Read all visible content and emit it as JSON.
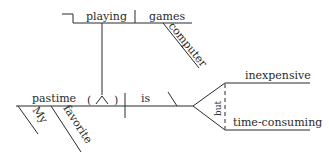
{
  "diagram": {
    "type": "sentence-diagram",
    "sentence": "My favorite pastime (playing computer games) is inexpensive but time-consuming",
    "words": {
      "subject": "pastime",
      "appositive_verbal": "playing",
      "verbal_object": "games",
      "verbal_object_modifier": "computer",
      "verb": "is",
      "complement_1": "inexpensive",
      "complement_2": "time-consuming",
      "conjunction": "but",
      "modifier_1": "My",
      "modifier_2": "favorite",
      "paren_open": "(",
      "paren_close": ")"
    },
    "colors": {
      "ink": "#2a2a2a",
      "background": "#ffffff"
    }
  }
}
